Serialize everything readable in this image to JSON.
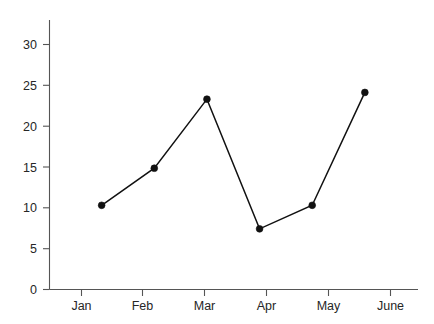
{
  "chart_data": {
    "type": "line",
    "title": "",
    "subtitle": "",
    "xlabel": "",
    "ylabel": "",
    "categories": [
      "Jan",
      "Feb",
      "Mar",
      "Apr",
      "May",
      "June"
    ],
    "values": [
      10.0,
      14.4,
      22.6,
      7.2,
      10.0,
      23.4
    ],
    "series": [
      {
        "name": "",
        "values": [
          10.0,
          14.4,
          22.6,
          7.2,
          10.0,
          23.4
        ]
      }
    ],
    "ylim": [
      0,
      32
    ],
    "xlim": [
      0,
      7
    ],
    "yticks": [
      0,
      5,
      10,
      15,
      20,
      25,
      30
    ],
    "ytick_labels": [
      "0",
      "5",
      "10",
      "15",
      "20",
      "25",
      "30"
    ],
    "xtick_labels": [
      "Jan",
      "Feb",
      "Mar",
      "Apr",
      "May",
      "June"
    ],
    "grid": false,
    "legend": false,
    "legend_position": "none",
    "marker": "circle",
    "line_color": "#111111",
    "marker_color": "#111111",
    "axis_color": "#555555",
    "text_color": "#262626",
    "background_color": "#ffffff",
    "annotations": []
  },
  "axis": {
    "y_tick_0": "0",
    "y_tick_5": "5",
    "y_tick_10": "10",
    "y_tick_15": "15",
    "y_tick_20": "20",
    "y_tick_25": "25",
    "y_tick_30": "30",
    "x_tick_jan": "Jan",
    "x_tick_feb": "Feb",
    "x_tick_mar": "Mar",
    "x_tick_apr": "Apr",
    "x_tick_may": "May",
    "x_tick_june": "June"
  }
}
